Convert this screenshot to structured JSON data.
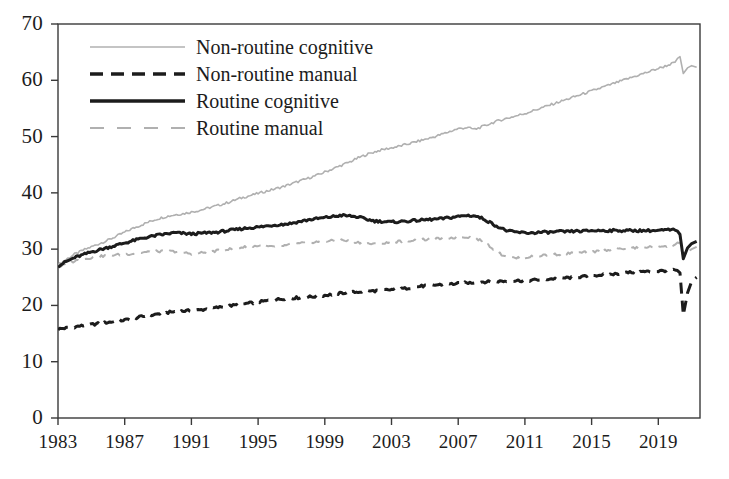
{
  "chart_data": {
    "type": "line",
    "title": "",
    "subtitle": "",
    "xlabel": "",
    "ylabel": "",
    "xlim": [
      1983,
      2021.5
    ],
    "ylim": [
      0,
      70
    ],
    "grid": false,
    "legend_position": "top-left",
    "y_ticks": [
      0,
      10,
      20,
      30,
      40,
      50,
      60,
      70
    ],
    "y_tick_labels": [
      "0",
      "10",
      "20",
      "30",
      "40",
      "50",
      "60",
      "70"
    ],
    "x_ticks": [
      1983,
      1987,
      1991,
      1995,
      1999,
      2003,
      2007,
      2011,
      2015,
      2019
    ],
    "x_tick_labels": [
      "1983",
      "1987",
      "1991",
      "1995",
      "1999",
      "2003",
      "2007",
      "2011",
      "2015",
      "2019"
    ],
    "colors": {
      "non_routine_cognitive": "#b0b0b0",
      "non_routine_manual": "#1c1c1c",
      "routine_cognitive": "#1c1c1c",
      "routine_manual": "#b0b0b0",
      "axis": "#3a3a3a",
      "background": "#ffffff"
    },
    "series": [
      {
        "name": "Non-routine cognitive",
        "style": "solid",
        "color": "#b0b0b0",
        "width": 1.6,
        "x": [
          1983.0,
          1983.5,
          1984.0,
          1984.5,
          1985.0,
          1985.5,
          1986.0,
          1986.5,
          1987.0,
          1987.5,
          1988.0,
          1988.5,
          1989.0,
          1989.5,
          1990.0,
          1990.5,
          1991.0,
          1991.5,
          1992.0,
          1992.5,
          1993.0,
          1993.5,
          1994.0,
          1994.5,
          1995.0,
          1995.5,
          1996.0,
          1996.5,
          1997.0,
          1997.5,
          1998.0,
          1998.5,
          1999.0,
          1999.5,
          2000.0,
          2000.5,
          2001.0,
          2001.5,
          2002.0,
          2002.5,
          2003.0,
          2003.5,
          2004.0,
          2004.5,
          2005.0,
          2005.5,
          2006.0,
          2006.5,
          2007.0,
          2007.5,
          2008.0,
          2008.5,
          2009.0,
          2009.5,
          2010.0,
          2010.5,
          2011.0,
          2011.5,
          2012.0,
          2012.5,
          2013.0,
          2013.5,
          2014.0,
          2014.5,
          2015.0,
          2015.5,
          2016.0,
          2016.5,
          2017.0,
          2017.5,
          2018.0,
          2018.5,
          2019.0,
          2019.5,
          2020.0,
          2020.15,
          2020.3,
          2020.5,
          2020.75,
          2021.0,
          2021.3
        ],
        "values": [
          27.2,
          28.2,
          29.1,
          29.8,
          30.4,
          31.0,
          31.6,
          32.3,
          33.0,
          33.7,
          34.3,
          34.9,
          35.4,
          35.8,
          36.1,
          36.3,
          36.6,
          36.9,
          37.3,
          37.7,
          38.1,
          38.6,
          39.1,
          39.5,
          39.9,
          40.3,
          40.7,
          41.1,
          41.6,
          42.1,
          42.6,
          43.1,
          43.7,
          44.3,
          44.9,
          45.5,
          46.2,
          46.8,
          47.3,
          47.7,
          48.0,
          48.3,
          48.7,
          49.1,
          49.5,
          49.9,
          50.4,
          50.9,
          51.4,
          51.6,
          51.3,
          51.8,
          52.4,
          52.9,
          53.3,
          53.7,
          54.1,
          54.6,
          55.1,
          55.6,
          56.1,
          56.6,
          57.1,
          57.6,
          58.1,
          58.6,
          59.1,
          59.6,
          60.1,
          60.6,
          61.1,
          61.6,
          62.1,
          62.6,
          63.2,
          63.9,
          64.2,
          61.2,
          62.2,
          62.6,
          62.3
        ]
      },
      {
        "name": "Non-routine manual",
        "style": "dashed",
        "color": "#1c1c1c",
        "width": 3.0,
        "x": [
          1983.0,
          1983.5,
          1984.0,
          1984.5,
          1985.0,
          1985.5,
          1986.0,
          1986.5,
          1987.0,
          1987.5,
          1988.0,
          1988.5,
          1989.0,
          1989.5,
          1990.0,
          1990.5,
          1991.0,
          1991.5,
          1992.0,
          1992.5,
          1993.0,
          1993.5,
          1994.0,
          1994.5,
          1995.0,
          1995.5,
          1996.0,
          1996.5,
          1997.0,
          1997.5,
          1998.0,
          1998.5,
          1999.0,
          1999.5,
          2000.0,
          2000.5,
          2001.0,
          2001.5,
          2002.0,
          2002.5,
          2003.0,
          2003.5,
          2004.0,
          2004.5,
          2005.0,
          2005.5,
          2006.0,
          2006.5,
          2007.0,
          2007.5,
          2008.0,
          2008.5,
          2009.0,
          2009.5,
          2010.0,
          2010.5,
          2011.0,
          2011.5,
          2012.0,
          2012.5,
          2013.0,
          2013.5,
          2014.0,
          2014.5,
          2015.0,
          2015.5,
          2016.0,
          2016.5,
          2017.0,
          2017.5,
          2018.0,
          2018.5,
          2019.0,
          2019.5,
          2020.0,
          2020.15,
          2020.3,
          2020.5,
          2020.75,
          2021.0,
          2021.3
        ],
        "values": [
          15.8,
          16.0,
          16.2,
          16.4,
          16.6,
          16.8,
          17.0,
          17.2,
          17.4,
          17.7,
          18.0,
          18.2,
          18.5,
          18.7,
          18.9,
          19.0,
          19.1,
          19.2,
          19.4,
          19.6,
          19.8,
          20.0,
          20.2,
          20.4,
          20.6,
          20.8,
          21.0,
          21.2,
          21.3,
          21.4,
          21.5,
          21.6,
          21.8,
          22.0,
          22.2,
          22.3,
          22.4,
          22.5,
          22.6,
          22.7,
          22.8,
          22.9,
          23.1,
          23.3,
          23.5,
          23.6,
          23.7,
          23.8,
          23.9,
          24.0,
          24.1,
          24.2,
          24.2,
          24.3,
          24.3,
          24.4,
          24.4,
          24.5,
          24.6,
          24.7,
          24.8,
          24.9,
          25.0,
          25.1,
          25.3,
          25.4,
          25.5,
          25.6,
          25.8,
          25.9,
          26.0,
          26.0,
          26.1,
          26.2,
          26.3,
          26.2,
          25.8,
          18.3,
          22.2,
          24.3,
          25.0
        ]
      },
      {
        "name": "Routine cognitive",
        "style": "solid",
        "color": "#1c1c1c",
        "width": 3.0,
        "x": [
          1983.0,
          1983.5,
          1984.0,
          1984.5,
          1985.0,
          1985.5,
          1986.0,
          1986.5,
          1987.0,
          1987.5,
          1988.0,
          1988.5,
          1989.0,
          1989.5,
          1990.0,
          1990.5,
          1991.0,
          1991.5,
          1992.0,
          1992.5,
          1993.0,
          1993.5,
          1994.0,
          1994.5,
          1995.0,
          1995.5,
          1996.0,
          1996.5,
          1997.0,
          1997.5,
          1998.0,
          1998.5,
          1999.0,
          1999.5,
          2000.0,
          2000.5,
          2001.0,
          2001.5,
          2002.0,
          2002.5,
          2003.0,
          2003.5,
          2004.0,
          2004.5,
          2005.0,
          2005.5,
          2006.0,
          2006.5,
          2007.0,
          2007.5,
          2008.0,
          2008.5,
          2009.0,
          2009.5,
          2010.0,
          2010.5,
          2011.0,
          2011.5,
          2012.0,
          2012.5,
          2013.0,
          2013.5,
          2014.0,
          2014.5,
          2015.0,
          2015.5,
          2016.0,
          2016.5,
          2017.0,
          2017.5,
          2018.0,
          2018.5,
          2019.0,
          2019.5,
          2020.0,
          2020.15,
          2020.3,
          2020.5,
          2020.75,
          2021.0,
          2021.3
        ],
        "values": [
          27.0,
          27.8,
          28.5,
          29.0,
          29.5,
          29.9,
          30.3,
          30.7,
          31.1,
          31.5,
          31.9,
          32.2,
          32.5,
          32.7,
          32.9,
          32.8,
          32.7,
          32.8,
          32.9,
          33.0,
          33.2,
          33.4,
          33.6,
          33.8,
          33.9,
          34.1,
          34.3,
          34.4,
          34.6,
          34.9,
          35.2,
          35.4,
          35.6,
          35.8,
          36.0,
          35.9,
          35.7,
          35.3,
          35.0,
          34.9,
          34.8,
          34.9,
          35.0,
          35.1,
          35.2,
          35.3,
          35.4,
          35.6,
          35.8,
          36.0,
          35.9,
          35.4,
          34.6,
          33.8,
          33.2,
          33.0,
          32.9,
          32.9,
          33.0,
          33.0,
          33.1,
          33.1,
          33.2,
          33.2,
          33.3,
          33.3,
          33.3,
          33.3,
          33.3,
          33.3,
          33.3,
          33.3,
          33.3,
          33.4,
          33.4,
          33.2,
          32.6,
          28.3,
          30.2,
          31.0,
          31.4
        ]
      },
      {
        "name": "Routine manual",
        "style": "dashed",
        "color": "#b0b0b0",
        "width": 2.0,
        "x": [
          1983.0,
          1983.5,
          1984.0,
          1984.5,
          1985.0,
          1985.5,
          1986.0,
          1986.5,
          1987.0,
          1987.5,
          1988.0,
          1988.5,
          1989.0,
          1989.5,
          1990.0,
          1990.5,
          1991.0,
          1991.5,
          1992.0,
          1992.5,
          1993.0,
          1993.5,
          1994.0,
          1994.5,
          1995.0,
          1995.5,
          1996.0,
          1996.5,
          1997.0,
          1997.5,
          1998.0,
          1998.5,
          1999.0,
          1999.5,
          2000.0,
          2000.5,
          2001.0,
          2001.5,
          2002.0,
          2002.5,
          2003.0,
          2003.5,
          2004.0,
          2004.5,
          2005.0,
          2005.5,
          2006.0,
          2006.5,
          2007.0,
          2007.5,
          2008.0,
          2008.5,
          2009.0,
          2009.5,
          2010.0,
          2010.5,
          2011.0,
          2011.5,
          2012.0,
          2012.5,
          2013.0,
          2013.5,
          2014.0,
          2014.5,
          2015.0,
          2015.5,
          2016.0,
          2016.5,
          2017.0,
          2017.5,
          2018.0,
          2018.5,
          2019.0,
          2019.5,
          2020.0,
          2020.15,
          2020.3,
          2020.5,
          2020.75,
          2021.0,
          2021.3
        ],
        "values": [
          26.8,
          27.4,
          27.9,
          28.2,
          28.5,
          28.7,
          28.9,
          29.0,
          29.1,
          29.2,
          29.4,
          29.5,
          29.6,
          29.6,
          29.6,
          29.4,
          29.2,
          29.3,
          29.5,
          29.7,
          29.9,
          30.1,
          30.3,
          30.5,
          30.6,
          30.5,
          30.4,
          30.6,
          30.8,
          31.0,
          31.2,
          31.3,
          31.4,
          31.5,
          31.6,
          31.4,
          31.2,
          31.0,
          30.9,
          31.0,
          31.2,
          31.4,
          31.5,
          31.6,
          31.7,
          31.8,
          31.9,
          32.0,
          32.1,
          32.2,
          32.0,
          31.4,
          30.3,
          29.2,
          28.6,
          28.4,
          28.5,
          28.7,
          28.9,
          29.0,
          29.1,
          29.2,
          29.3,
          29.4,
          29.5,
          29.7,
          29.9,
          30.0,
          30.1,
          30.2,
          30.3,
          30.4,
          30.5,
          30.6,
          30.8,
          31.2,
          31.0,
          28.6,
          29.5,
          30.0,
          30.4
        ]
      }
    ],
    "annotations": []
  },
  "legend": {
    "items": [
      {
        "label": "Non-routine cognitive",
        "style": "solid",
        "color": "#b0b0b0",
        "width": 1.6
      },
      {
        "label": "Non-routine manual",
        "style": "dashed",
        "color": "#1c1c1c",
        "width": 3.4
      },
      {
        "label": "Routine cognitive",
        "style": "solid",
        "color": "#1c1c1c",
        "width": 3.4
      },
      {
        "label": "Routine manual",
        "style": "dashed",
        "color": "#b0b0b0",
        "width": 2.0
      }
    ]
  }
}
